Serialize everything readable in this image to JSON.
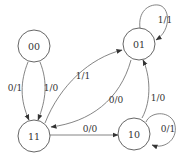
{
  "diagram": {
    "type": "state-transition-diagram",
    "states": [
      {
        "id": "00",
        "label": "00"
      },
      {
        "id": "01",
        "label": "01"
      },
      {
        "id": "11",
        "label": "11"
      },
      {
        "id": "10",
        "label": "10"
      }
    ],
    "transitions": [
      {
        "from": "00",
        "to": "11",
        "label": "0/1"
      },
      {
        "from": "00",
        "to": "11",
        "label": "1/0"
      },
      {
        "from": "11",
        "to": "01",
        "label": "1/1"
      },
      {
        "from": "01",
        "to": "11",
        "label": "0/0"
      },
      {
        "from": "01",
        "to": "01",
        "label": "1/1"
      },
      {
        "from": "11",
        "to": "10",
        "label": "0/0"
      },
      {
        "from": "10",
        "to": "01",
        "label": "1/0"
      },
      {
        "from": "10",
        "to": "10",
        "label": "0/1"
      }
    ]
  }
}
